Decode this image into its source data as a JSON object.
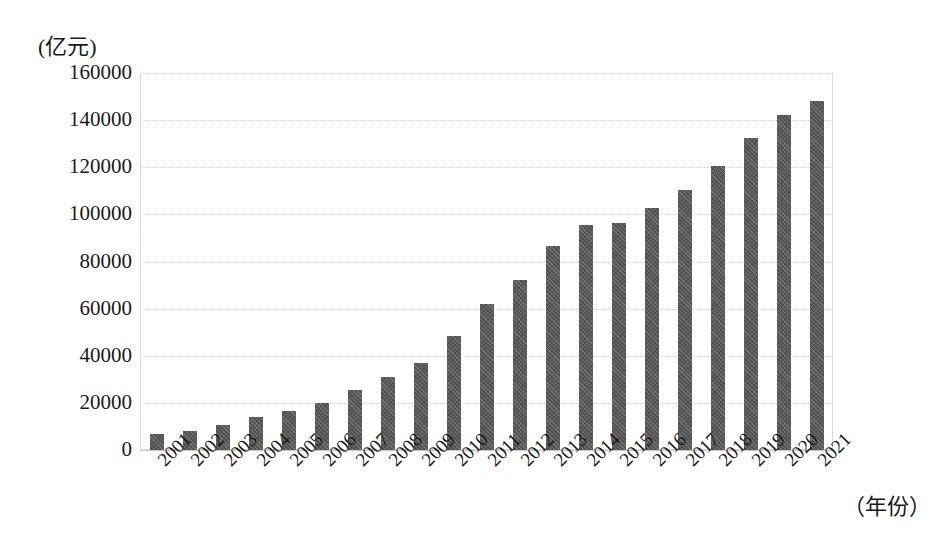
{
  "axes": {
    "y_unit_label": "(亿元)",
    "x_unit_label": "（年份）",
    "y_ticks": [
      "160000",
      "140000",
      "120000",
      "100000",
      "80000",
      "60000",
      "40000",
      "20000",
      "0"
    ]
  },
  "colors": {
    "bar_fill": "#595959",
    "gridline": "#cfcfcf",
    "text": "#1a1a1a",
    "background": "#ffffff"
  },
  "chart_data": {
    "type": "bar",
    "title": "",
    "subtitle": "",
    "xlabel": "（年份）",
    "ylabel": "(亿元)",
    "ylim": [
      0,
      160000
    ],
    "ytick_step": 20000,
    "grid": true,
    "legend": false,
    "xtick_rotation": -45,
    "categories": [
      "2001",
      "2002",
      "2003",
      "2004",
      "2005",
      "2006",
      "2007",
      "2008",
      "2009",
      "2010",
      "2011",
      "2012",
      "2013",
      "2014",
      "2015",
      "2016",
      "2017",
      "2018",
      "2019",
      "2020",
      "2021"
    ],
    "values": [
      6800,
      8200,
      10800,
      13900,
      16400,
      20100,
      25600,
      31000,
      36800,
      48500,
      62000,
      72000,
      86500,
      95500,
      96300,
      102500,
      110300,
      120600,
      132400,
      142000,
      148000
    ]
  }
}
